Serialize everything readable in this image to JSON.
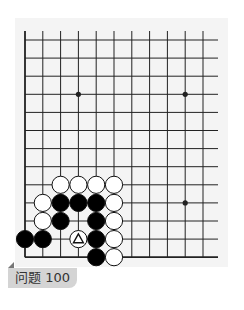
{
  "problem": {
    "label": "问题 100"
  },
  "board": {
    "origin_x": 25,
    "origin_y": 40,
    "spacing_x": 17.8,
    "spacing_y": 18.1,
    "columns": 11,
    "rows": 13,
    "line_top_y": 31,
    "line_right_x": 218,
    "bottom_edge": true,
    "left_edge": true,
    "colors": {
      "background": "#f4f4f4",
      "line": "#222222",
      "black_stone": "#000000",
      "white_stone": "#ffffff"
    },
    "star_points": [
      {
        "col": 3,
        "row": 3
      },
      {
        "col": 9,
        "row": 3
      },
      {
        "col": 9,
        "row": 9
      }
    ],
    "stones": [
      {
        "col": 2,
        "row": 8,
        "color": "white"
      },
      {
        "col": 3,
        "row": 8,
        "color": "white"
      },
      {
        "col": 4,
        "row": 8,
        "color": "white"
      },
      {
        "col": 5,
        "row": 8,
        "color": "white"
      },
      {
        "col": 1,
        "row": 9,
        "color": "white"
      },
      {
        "col": 2,
        "row": 9,
        "color": "black"
      },
      {
        "col": 3,
        "row": 9,
        "color": "black"
      },
      {
        "col": 4,
        "row": 9,
        "color": "black"
      },
      {
        "col": 5,
        "row": 9,
        "color": "white"
      },
      {
        "col": 1,
        "row": 10,
        "color": "white"
      },
      {
        "col": 2,
        "row": 10,
        "color": "black"
      },
      {
        "col": 4,
        "row": 10,
        "color": "black"
      },
      {
        "col": 5,
        "row": 10,
        "color": "white"
      },
      {
        "col": 0,
        "row": 11,
        "color": "black"
      },
      {
        "col": 1,
        "row": 11,
        "color": "black"
      },
      {
        "col": 3,
        "row": 11,
        "color": "white",
        "marker": "triangle"
      },
      {
        "col": 4,
        "row": 11,
        "color": "black"
      },
      {
        "col": 5,
        "row": 11,
        "color": "white"
      },
      {
        "col": 4,
        "row": 12,
        "color": "black"
      },
      {
        "col": 5,
        "row": 12,
        "color": "white"
      }
    ]
  }
}
